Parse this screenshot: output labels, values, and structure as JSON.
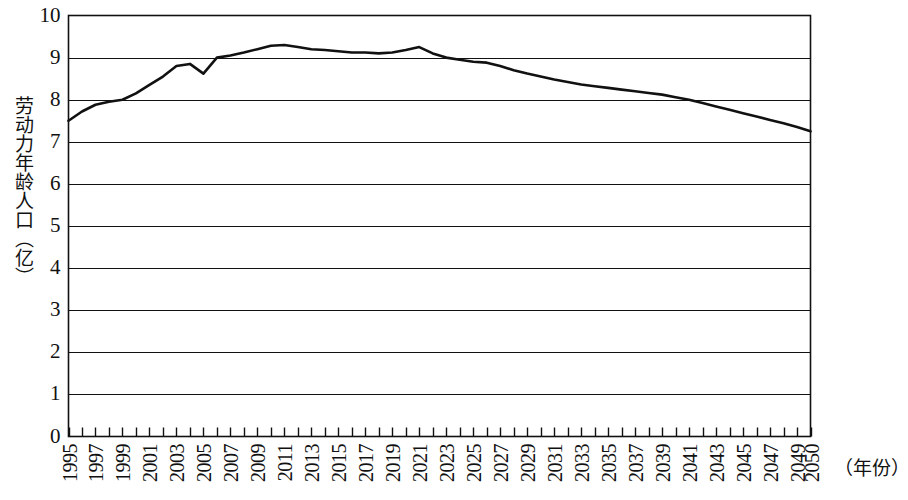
{
  "chart_data": {
    "type": "line",
    "title": "",
    "subtitle": "",
    "xlabel": "（年份）",
    "ylabel": "劳动力年龄人口（亿）",
    "xlim": [
      1995,
      2050
    ],
    "ylim": [
      0,
      10
    ],
    "grid": true,
    "legend": false,
    "legend_position": "none",
    "y_ticks": [
      10,
      9,
      8,
      7,
      6,
      5,
      4,
      3,
      2,
      1,
      0
    ],
    "x_tick_years": [
      1995,
      1996,
      1997,
      1998,
      1999,
      2000,
      2001,
      2002,
      2003,
      2004,
      2005,
      2006,
      2007,
      2008,
      2009,
      2010,
      2011,
      2012,
      2013,
      2014,
      2015,
      2016,
      2017,
      2018,
      2019,
      2020,
      2021,
      2022,
      2023,
      2024,
      2025,
      2026,
      2027,
      2028,
      2029,
      2030,
      2031,
      2032,
      2033,
      2034,
      2035,
      2036,
      2037,
      2038,
      2039,
      2040,
      2041,
      2042,
      2043,
      2044,
      2045,
      2046,
      2047,
      2048,
      2049,
      2050
    ],
    "x_tick_labels": [
      "1995",
      "1997",
      "1999",
      "2001",
      "2003",
      "2005",
      "2007",
      "2009",
      "2011",
      "2013",
      "2015",
      "2017",
      "2019",
      "2021",
      "2023",
      "2025",
      "2027",
      "2029",
      "2031",
      "2033",
      "2035",
      "2037",
      "2039",
      "2041",
      "2043",
      "2045",
      "2047",
      "2049",
      "2050"
    ],
    "series": [
      {
        "name": "劳动力年龄人口",
        "color": "#111111",
        "x": [
          1995,
          1996,
          1997,
          1998,
          1999,
          2000,
          2001,
          2002,
          2003,
          2004,
          2005,
          2006,
          2007,
          2008,
          2009,
          2010,
          2011,
          2012,
          2013,
          2014,
          2015,
          2016,
          2017,
          2018,
          2019,
          2020,
          2021,
          2022,
          2023,
          2024,
          2025,
          2026,
          2027,
          2028,
          2029,
          2030,
          2031,
          2032,
          2033,
          2034,
          2035,
          2036,
          2037,
          2038,
          2039,
          2040,
          2041,
          2042,
          2043,
          2044,
          2045,
          2046,
          2047,
          2048,
          2049,
          2050
        ],
        "values": [
          7.5,
          7.72,
          7.88,
          7.95,
          8.0,
          8.15,
          8.35,
          8.55,
          8.8,
          8.85,
          8.62,
          9.0,
          9.05,
          9.12,
          9.2,
          9.28,
          9.3,
          9.25,
          9.2,
          9.18,
          9.15,
          9.12,
          9.12,
          9.1,
          9.12,
          9.18,
          9.25,
          9.1,
          9.0,
          8.95,
          8.9,
          8.88,
          8.8,
          8.7,
          8.62,
          8.55,
          8.48,
          8.42,
          8.36,
          8.32,
          8.28,
          8.24,
          8.2,
          8.16,
          8.12,
          8.06,
          8.0,
          7.92,
          7.84,
          7.76,
          7.68,
          7.6,
          7.52,
          7.44,
          7.35,
          7.25
        ]
      }
    ]
  },
  "axis": {
    "y_title": "劳动力年龄人口（亿）",
    "x_title": "（年份）"
  }
}
